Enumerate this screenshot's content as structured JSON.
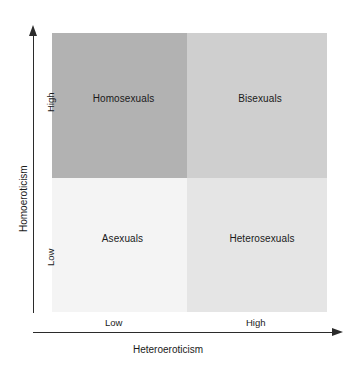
{
  "chart_data": {
    "type": "table",
    "title": "",
    "subtitle": "",
    "xlabel": "Heteroeroticism",
    "ylabel": "Homoeroticism",
    "x_tick_labels": [
      "Low",
      "High"
    ],
    "y_tick_labels": [
      "High",
      "Low"
    ],
    "grid": false,
    "legend": "none",
    "axis_style": "arrow-terminated",
    "categories": [
      "Low Heteroeroticism",
      "High Heteroeroticism"
    ],
    "row_categories": [
      "High Homoeroticism",
      "Low Homoeroticism"
    ],
    "cells": [
      {
        "id": "top-left",
        "label": "Homosexuals",
        "homoeroticism": "High",
        "heteroeroticism": "Low",
        "fill": "#b2b2b2"
      },
      {
        "id": "top-right",
        "label": "Bisexuals",
        "homoeroticism": "High",
        "heteroeroticism": "High",
        "fill": "#cfcfcf"
      },
      {
        "id": "bottom-left",
        "label": "Asexuals",
        "homoeroticism": "Low",
        "heteroeroticism": "Low",
        "fill": "#f4f4f4"
      },
      {
        "id": "bottom-right",
        "label": "Heterosexuals",
        "homoeroticism": "Low",
        "heteroeroticism": "High",
        "fill": "#e5e5e5"
      }
    ]
  },
  "axes": {
    "x": {
      "title": "Heteroeroticism",
      "ticks": {
        "low": "Low",
        "high": "High"
      }
    },
    "y": {
      "title": "Homoeroticism",
      "ticks": {
        "low": "Low",
        "high": "High"
      }
    }
  },
  "quadrants": {
    "top_left": "Homosexuals",
    "top_right": "Bisexuals",
    "bottom_left": "Asexuals",
    "bottom_right": "Heterosexuals"
  },
  "colors": {
    "top_left": "#b2b2b2",
    "top_right": "#cfcfcf",
    "bottom_left": "#f4f4f4",
    "bottom_right": "#e5e5e5",
    "axis": "#2b2b2b",
    "text": "#1a1a1a",
    "background": "#ffffff"
  }
}
